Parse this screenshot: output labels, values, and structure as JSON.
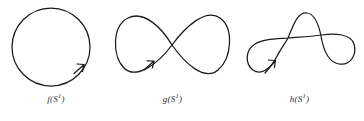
{
  "figure": {
    "background_color": "#ffffff",
    "stroke_color": "#1a1a1a",
    "panels": [
      {
        "id": "f",
        "caption_function": "f",
        "caption_arg_open": "(S",
        "caption_exponent": "1",
        "caption_arg_close": ")",
        "caption_full": "f(S¹)",
        "curve_type": "simple-closed-circle",
        "self_intersections": 0,
        "orientation": "counterclockwise",
        "arrow_position": "lower-right",
        "center": [
          51,
          47
        ],
        "radius": 39
      },
      {
        "id": "g",
        "caption_function": "g",
        "caption_arg_open": "(S",
        "caption_exponent": "1",
        "caption_arg_close": ")",
        "caption_full": "g(S¹)",
        "curve_type": "figure-eight",
        "self_intersections": 1,
        "orientation": "counterclockwise",
        "arrow_position": "lower-left-of-crossing",
        "crossing_points": [
          [
            62,
            45
          ]
        ],
        "bounds": [
          114,
          14,
          228,
          80
        ]
      },
      {
        "id": "h",
        "caption_function": "h",
        "caption_arg_open": "(S",
        "caption_exponent": "1",
        "caption_arg_close": ")",
        "caption_full": "h(S¹)",
        "curve_type": "double-loop-arch",
        "self_intersections": 2,
        "orientation": "counterclockwise",
        "arrow_position": "lower-left-loop",
        "crossing_points": [
          [
            53,
            38
          ],
          [
            87,
            35
          ]
        ],
        "bounds": [
          248,
          14,
          357,
          88
        ]
      }
    ]
  }
}
